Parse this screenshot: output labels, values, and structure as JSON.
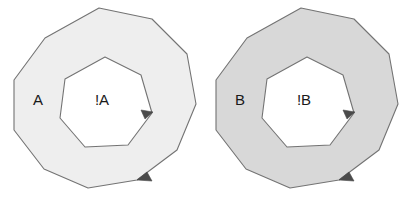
{
  "figure": {
    "background_color": "#ffffff",
    "width": 409,
    "height": 207,
    "stroke_color": "#737373",
    "stroke_width": 1.1,
    "arrow_color": "#4a4a4a"
  },
  "diagrams": [
    {
      "id": "diagram-a",
      "outer_label": "A",
      "inner_label": "!A",
      "fill_color": "#eeeeee",
      "outer_label_x": 38,
      "outer_label_y": 101,
      "inner_label_x": 102,
      "inner_label_y": 101,
      "outer_shape": "decagon",
      "inner_shape": "heptagon",
      "outer_points": "99,8 152,19 187,54 196,104 177,150 137,180 88,188 44,169 14,130 14,80 45,38",
      "inner_points": "105,57 141,75 152,113 128,145 85,147 60,118 65,79",
      "outer_arrow_points": "152,181 137,180 147,172",
      "inner_arrow_points": "153,112 145,119 141,110",
      "outer_arrow_direction": "counterclockwise",
      "inner_arrow_direction": "clockwise"
    },
    {
      "id": "diagram-b",
      "outer_label": "B",
      "inner_label": "!B",
      "fill_color": "#d8d8d8",
      "outer_label_x": 240,
      "outer_label_y": 101,
      "inner_label_x": 304,
      "inner_label_y": 101,
      "outer_shape": "decagon",
      "inner_shape": "heptagon",
      "outer_points": "301,8 354,19 389,54 398,104 379,150 339,180 290,188 246,169 216,130 216,80 247,38",
      "inner_points": "307,57 343,75 354,113 330,145 287,147 262,118 267,79",
      "outer_arrow_points": "354,181 339,180 349,172",
      "inner_arrow_points": "355,112 347,119 343,110",
      "outer_arrow_direction": "counterclockwise",
      "inner_arrow_direction": "clockwise"
    }
  ]
}
